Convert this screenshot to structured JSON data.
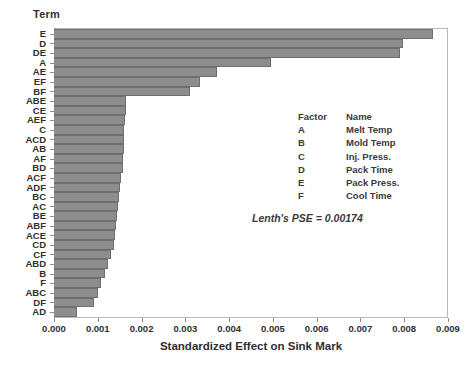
{
  "axis_header": {
    "term_label": "Term"
  },
  "chart_data": {
    "type": "bar",
    "orientation": "horizontal",
    "title": "",
    "xlabel": "Standardized Effect on Sink Mark",
    "ylabel": "Term",
    "xlim": [
      0.0,
      0.009
    ],
    "grid": false,
    "legend_position": "inside-right",
    "xticklabels": [
      "0.000",
      "0.001",
      "0.002",
      "0.003",
      "0.004",
      "0.005",
      "0.006",
      "0.007",
      "0.008",
      "0.009"
    ],
    "xtickvalues": [
      0.0,
      0.001,
      0.002,
      0.003,
      0.004,
      0.005,
      0.006,
      0.007,
      0.008,
      0.009
    ],
    "categories": [
      "E",
      "D",
      "DE",
      "A",
      "AE",
      "EF",
      "BF",
      "ABE",
      "CE",
      "AEF",
      "C",
      "ACD",
      "AB",
      "AF",
      "BD",
      "ACF",
      "ADF",
      "BC",
      "AC",
      "BE",
      "ABF",
      "ACE",
      "CD",
      "CF",
      "ABD",
      "B",
      "F",
      "ABC",
      "DF",
      "AD"
    ],
    "values": [
      0.00866,
      0.00798,
      0.0079,
      0.00495,
      0.00372,
      0.00334,
      0.00311,
      0.00165,
      0.00164,
      0.00163,
      0.00161,
      0.0016,
      0.00159,
      0.00158,
      0.00157,
      0.00152,
      0.0015,
      0.00148,
      0.00146,
      0.00144,
      0.00142,
      0.0014,
      0.00136,
      0.00131,
      0.00124,
      0.00116,
      0.00107,
      0.001,
      0.00092,
      0.00053
    ],
    "annotation": "Lenth's PSE = 0.00174",
    "bar_color": "#8d8d8d",
    "bar_edge_color": "#6f6f6f"
  },
  "factor_legend": {
    "header": {
      "code": "Factor",
      "name": "Name"
    },
    "rows": [
      {
        "code": "A",
        "name": "Melt Temp"
      },
      {
        "code": "B",
        "name": "Mold Temp"
      },
      {
        "code": "C",
        "name": "Inj. Press."
      },
      {
        "code": "D",
        "name": "Pack Time"
      },
      {
        "code": "E",
        "name": "Pack Press."
      },
      {
        "code": "F",
        "name": "Cool Time"
      }
    ]
  }
}
